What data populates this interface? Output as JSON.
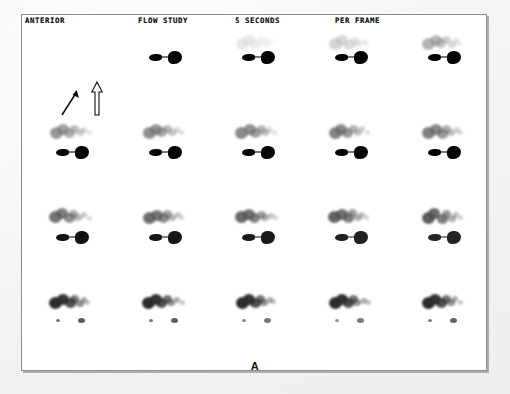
{
  "study": {
    "modality_label": "ANTERIOR",
    "study_type": "FLOW STUDY",
    "frame_duration": "5 SECONDS",
    "frame_duration_suffix": "PER FRAME",
    "figure_label": "A",
    "grid": {
      "columns": 5,
      "rows": 4,
      "total_frames": 20
    },
    "colors": {
      "page_background": "#f4f4f2",
      "frame_background": "#ffffff",
      "frame_border": "#8d8d8d",
      "tracer_dark": "#050505",
      "tracer_mid": "#2c2c2c",
      "text": "#1a1a1a"
    }
  },
  "annotations": [
    {
      "name": "solid-arrow",
      "style": "solid",
      "direction": "up-right",
      "points_to": "upper-tracer-tail"
    },
    {
      "name": "hollow-arrow",
      "style": "outline",
      "direction": "up",
      "points_to": "dominant-hot-spot"
    }
  ],
  "frames": [
    {
      "index": 1,
      "row": 1,
      "col": 1,
      "cluster_intensity": 0.0,
      "hot_intensity": 0.0,
      "hot_offset_x": 0
    },
    {
      "index": 2,
      "row": 1,
      "col": 2,
      "cluster_intensity": 0.0,
      "hot_intensity": 0.95,
      "hot_offset_x": 0
    },
    {
      "index": 3,
      "row": 1,
      "col": 3,
      "cluster_intensity": 0.08,
      "hot_intensity": 0.95,
      "hot_offset_x": 0
    },
    {
      "index": 4,
      "row": 1,
      "col": 4,
      "cluster_intensity": 0.22,
      "hot_intensity": 0.95,
      "hot_offset_x": 0
    },
    {
      "index": 5,
      "row": 1,
      "col": 5,
      "cluster_intensity": 0.4,
      "hot_intensity": 0.95,
      "hot_offset_x": 0
    },
    {
      "index": 6,
      "row": 2,
      "col": 1,
      "cluster_intensity": 0.52,
      "hot_intensity": 0.92,
      "hot_offset_x": 0
    },
    {
      "index": 7,
      "row": 2,
      "col": 2,
      "cluster_intensity": 0.56,
      "hot_intensity": 0.92,
      "hot_offset_x": 0
    },
    {
      "index": 8,
      "row": 2,
      "col": 3,
      "cluster_intensity": 0.58,
      "hot_intensity": 0.92,
      "hot_offset_x": 0
    },
    {
      "index": 9,
      "row": 2,
      "col": 4,
      "cluster_intensity": 0.6,
      "hot_intensity": 0.92,
      "hot_offset_x": 0
    },
    {
      "index": 10,
      "row": 2,
      "col": 5,
      "cluster_intensity": 0.62,
      "hot_intensity": 0.92,
      "hot_offset_x": 0
    },
    {
      "index": 11,
      "row": 3,
      "col": 1,
      "cluster_intensity": 0.66,
      "hot_intensity": 0.8,
      "hot_offset_x": 0
    },
    {
      "index": 12,
      "row": 3,
      "col": 2,
      "cluster_intensity": 0.68,
      "hot_intensity": 0.78,
      "hot_offset_x": 0
    },
    {
      "index": 13,
      "row": 3,
      "col": 3,
      "cluster_intensity": 0.7,
      "hot_intensity": 0.76,
      "hot_offset_x": 0
    },
    {
      "index": 14,
      "row": 3,
      "col": 4,
      "cluster_intensity": 0.72,
      "hot_intensity": 0.74,
      "hot_offset_x": 0
    },
    {
      "index": 15,
      "row": 3,
      "col": 5,
      "cluster_intensity": 0.74,
      "hot_intensity": 0.72,
      "hot_offset_x": 0
    },
    {
      "index": 16,
      "row": 4,
      "col": 1,
      "cluster_intensity": 0.92,
      "hot_intensity": 0.45,
      "hot_offset_x": 0
    },
    {
      "index": 17,
      "row": 4,
      "col": 2,
      "cluster_intensity": 0.92,
      "hot_intensity": 0.42,
      "hot_offset_x": 0
    },
    {
      "index": 18,
      "row": 4,
      "col": 3,
      "cluster_intensity": 0.92,
      "hot_intensity": 0.3,
      "hot_offset_x": 0
    },
    {
      "index": 19,
      "row": 4,
      "col": 4,
      "cluster_intensity": 0.92,
      "hot_intensity": 0.28,
      "hot_offset_x": 0
    },
    {
      "index": 20,
      "row": 4,
      "col": 5,
      "cluster_intensity": 0.92,
      "hot_intensity": 0.4,
      "hot_offset_x": 0
    }
  ]
}
